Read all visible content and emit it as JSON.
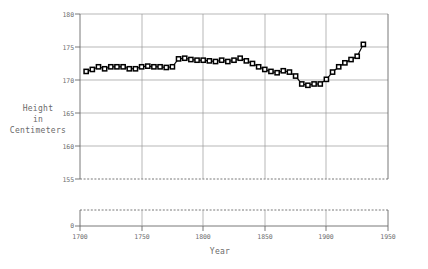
{
  "chart_data": {
    "type": "line",
    "title": "",
    "subtitle": "",
    "xlabel": "Year",
    "ylabel": "Height\nin\nCentimeters",
    "ylabel_lines": [
      "Height",
      "in",
      "Centimeters"
    ],
    "xlim": [
      1700,
      1950
    ],
    "ylim": [
      155,
      180
    ],
    "y_broken_axis": true,
    "y_break_value": 0,
    "y_break_label": "0",
    "grid": true,
    "grid_x": true,
    "grid_y": true,
    "legend": null,
    "legend_position": "none",
    "marker": "square",
    "marker_color": "#000000",
    "line_color": "#000000",
    "xticks": [
      1700,
      1750,
      1800,
      1850,
      1900,
      1950
    ],
    "xtick_labels": [
      "1700",
      "1750",
      "1800",
      "1850",
      "1900",
      "1950"
    ],
    "yticks": [
      155,
      160,
      165,
      170,
      175,
      180
    ],
    "ytick_labels": [
      "155",
      "160",
      "165",
      "170",
      "175",
      "180"
    ],
    "series": [
      {
        "name": "Height in Centimeters",
        "x": [
          1705,
          1710,
          1715,
          1720,
          1725,
          1730,
          1735,
          1740,
          1745,
          1750,
          1755,
          1760,
          1765,
          1770,
          1775,
          1780,
          1785,
          1790,
          1795,
          1800,
          1805,
          1810,
          1815,
          1820,
          1825,
          1830,
          1835,
          1840,
          1845,
          1850,
          1855,
          1860,
          1865,
          1870,
          1875,
          1880,
          1885,
          1890,
          1895,
          1900,
          1905,
          1910,
          1915,
          1920,
          1925,
          1930
        ],
        "y": [
          171.3,
          171.6,
          172.0,
          171.7,
          172.0,
          172.0,
          172.0,
          171.7,
          171.7,
          172.0,
          172.1,
          172.0,
          172.0,
          171.9,
          172.0,
          173.2,
          173.3,
          173.1,
          173.0,
          173.0,
          172.9,
          172.8,
          173.0,
          172.8,
          173.0,
          173.3,
          172.9,
          172.5,
          172.0,
          171.6,
          171.3,
          171.1,
          171.4,
          171.2,
          170.6,
          169.4,
          169.2,
          169.4,
          169.4,
          170.1,
          171.2,
          172.0,
          172.6,
          173.1,
          173.6,
          175.4
        ]
      }
    ]
  }
}
